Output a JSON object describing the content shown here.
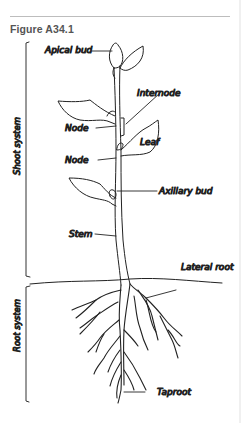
{
  "figure": {
    "title": "Figure A34.1"
  },
  "systems": {
    "shoot": "Shoot system",
    "root": "Root system"
  },
  "labels": {
    "apical_bud": "Apical bud",
    "internode": "Internode",
    "node_upper": "Node",
    "leaf": "Leaf",
    "node_lower": "Node",
    "axillary_bud": "Axillary bud",
    "stem": "Stem",
    "lateral_root": "Lateral root",
    "taproot": "Taproot"
  },
  "colors": {
    "line": "#222222",
    "title": "#555555",
    "rule": "#bdbdbd"
  }
}
